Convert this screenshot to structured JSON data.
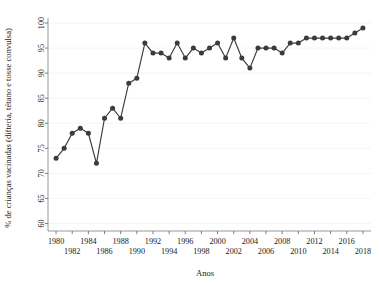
{
  "chart_data": {
    "type": "line",
    "title": "",
    "xlabel": "Anos",
    "ylabel": "% de crianças vacinadas (difteria, tétano e tosse convulsa)",
    "xlim": [
      1979,
      2019
    ],
    "ylim": [
      58.5,
      101
    ],
    "grid": true,
    "legend": "none",
    "marker": "circle",
    "line_color": "#3b3b3b",
    "marker_color": "#3b3b3b",
    "x": [
      1980,
      1981,
      1982,
      1983,
      1984,
      1985,
      1986,
      1987,
      1988,
      1989,
      1990,
      1991,
      1992,
      1993,
      1994,
      1995,
      1996,
      1997,
      1998,
      1999,
      2000,
      2001,
      2002,
      2003,
      2004,
      2005,
      2006,
      2007,
      2008,
      2009,
      2010,
      2011,
      2012,
      2013,
      2014,
      2015,
      2016,
      2017,
      2018
    ],
    "values": [
      73,
      75,
      78,
      79,
      78,
      72,
      81,
      83,
      81,
      88,
      89,
      96,
      94,
      94,
      93,
      96,
      93,
      95,
      94,
      95,
      96,
      93,
      97,
      93,
      91,
      95,
      95,
      95,
      94,
      96,
      96,
      97,
      97,
      97,
      97,
      97,
      97,
      98,
      99
    ],
    "ytick_values": [
      60,
      65,
      70,
      75,
      80,
      85,
      90,
      95,
      100
    ],
    "ytick_labels": [
      "60",
      "65",
      "70",
      "75",
      "80",
      "85",
      "90",
      "95",
      "100"
    ],
    "xtick_values": [
      1980,
      1982,
      1984,
      1986,
      1988,
      1990,
      1992,
      1994,
      1996,
      1998,
      2000,
      2002,
      2004,
      2006,
      2008,
      2010,
      2012,
      2014,
      2016,
      2018
    ],
    "xtick_labels": [
      "1980",
      "1982",
      "1984",
      "1986",
      "1988",
      "1990",
      "1992",
      "1994",
      "1996",
      "1998",
      "2000",
      "2002",
      "2004",
      "2006",
      "2008",
      "2010",
      "2012",
      "2014",
      "2016",
      "2018"
    ]
  }
}
